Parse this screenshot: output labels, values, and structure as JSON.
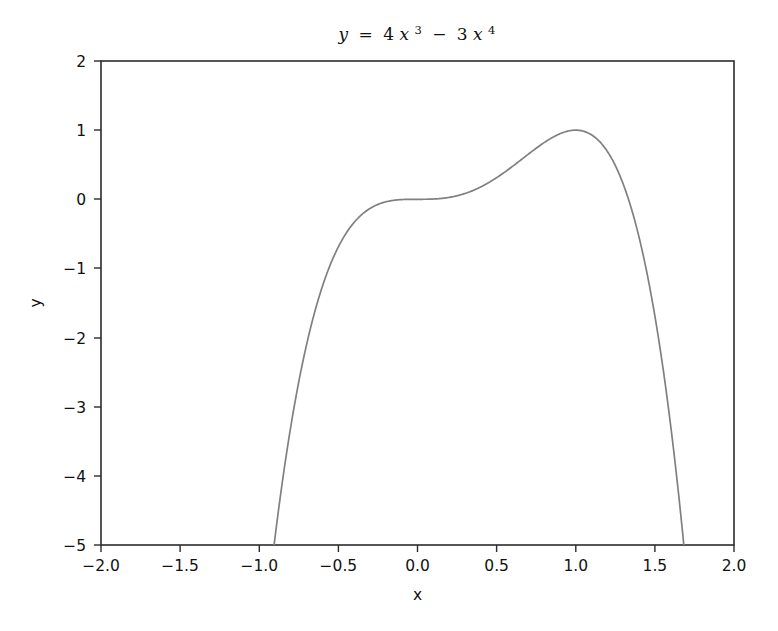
{
  "chart_data": {
    "type": "line",
    "title_parts": {
      "lhs": "y",
      "equals": "=",
      "term1_coef": "4",
      "term1_var": "x",
      "term1_exp": "3",
      "minus": "−",
      "term2_coef": "3",
      "term2_var": "x",
      "term2_exp": "4"
    },
    "xlabel": "x",
    "ylabel": "y",
    "xlim": [
      -2.0,
      2.0
    ],
    "ylim": [
      -5,
      2
    ],
    "xticks": [
      "−2.0",
      "−1.5",
      "−1.0",
      "−0.5",
      "0.0",
      "0.5",
      "1.0",
      "1.5",
      "2.0"
    ],
    "xtick_values": [
      -2.0,
      -1.5,
      -1.0,
      -0.5,
      0.0,
      0.5,
      1.0,
      1.5,
      2.0
    ],
    "yticks": [
      "2",
      "1",
      "0",
      "−1",
      "−2",
      "−3",
      "−4",
      "−5"
    ],
    "ytick_values": [
      2,
      1,
      0,
      -1,
      -2,
      -3,
      -4,
      -5
    ],
    "grid": false,
    "legend": null,
    "line_color": "#808080",
    "series": [
      {
        "name": "y = 4x^3 - 3x^4",
        "formula_coefficients": {
          "x3": 4,
          "x4": -3
        },
        "x": [
          -0.94,
          -0.92,
          -0.9,
          -0.85,
          -0.8,
          -0.75,
          -0.7,
          -0.65,
          -0.6,
          -0.55,
          -0.5,
          -0.45,
          -0.4,
          -0.35,
          -0.3,
          -0.25,
          -0.2,
          -0.15,
          -0.1,
          -0.05,
          0.0,
          0.05,
          0.1,
          0.15,
          0.2,
          0.25,
          0.3,
          0.35,
          0.4,
          0.45,
          0.5,
          0.55,
          0.6,
          0.65,
          0.7,
          0.75,
          0.8,
          0.85,
          0.9,
          0.95,
          1.0,
          1.05,
          1.1,
          1.15,
          1.2,
          1.25,
          1.3,
          1.35,
          1.4,
          1.45,
          1.5,
          1.55,
          1.6,
          1.65,
          1.68,
          1.7
        ],
        "y": [
          -5.68,
          -5.27,
          -4.88,
          -4.02,
          -3.28,
          -2.64,
          -2.09,
          -1.63,
          -1.25,
          -0.94,
          -0.69,
          -0.49,
          -0.33,
          -0.21,
          -0.13,
          -0.07,
          -0.04,
          -0.02,
          -0.005,
          -0.001,
          0.0,
          0.0005,
          0.004,
          0.012,
          0.027,
          0.051,
          0.084,
          0.127,
          0.179,
          0.242,
          0.313,
          0.391,
          0.475,
          0.563,
          0.652,
          0.738,
          0.819,
          0.889,
          0.946,
          0.983,
          1.0,
          0.99,
          0.95,
          0.876,
          0.763,
          0.604,
          0.393,
          0.124,
          -0.213,
          -0.626,
          -1.125,
          -1.72,
          -2.42,
          -3.236,
          -3.77,
          -4.181
        ]
      }
    ],
    "annotations": [
      {
        "label": "peak",
        "x": 1.0,
        "y": 1.0
      },
      {
        "label": "saddle",
        "x": 0.0,
        "y": 0.0
      }
    ]
  },
  "figure": {
    "background_color": "#ffffff",
    "axes_color": "#2b2b2b"
  }
}
